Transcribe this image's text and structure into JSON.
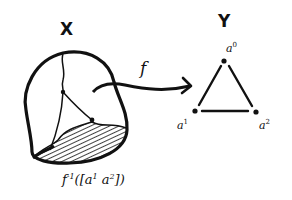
{
  "diagram": {
    "type": "topology-sketch",
    "domain_space": {
      "label": "X",
      "shape": "blob with internal graph",
      "shaded_region_caption": {
        "func": "f",
        "superscript": "-1",
        "argument": "([a",
        "arg_sup1": "1",
        "arg_mid": " a",
        "arg_sup2": "2",
        "arg_close": "])"
      }
    },
    "map": {
      "label": "f",
      "direction": "X → Y"
    },
    "codomain_space": {
      "label": "Y",
      "shape": "triangle",
      "vertices": [
        {
          "id": "top",
          "base": "a",
          "sup": "0"
        },
        {
          "id": "bottom-left",
          "base": "a",
          "sup": "1"
        },
        {
          "id": "bottom-right",
          "base": "a",
          "sup": "2"
        }
      ],
      "highlighted_edge": "[a1 a2]"
    },
    "colors": {
      "ink": "#111111",
      "background": "#ffffff"
    }
  }
}
